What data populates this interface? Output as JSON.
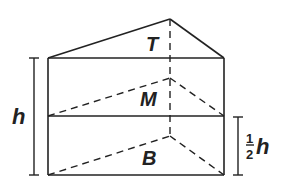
{
  "diagram": {
    "type": "triangular-prism",
    "labels": {
      "top": "T",
      "middle": "M",
      "bottom": "B",
      "height": "h",
      "half_height_num": "1",
      "half_height_den": "2",
      "half_height_var": "h"
    },
    "colors": {
      "stroke": "#222222",
      "background": "#ffffff"
    }
  }
}
